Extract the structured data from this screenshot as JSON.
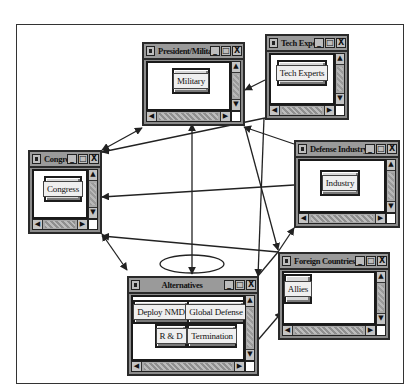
{
  "diagram": {
    "type": "influence network of windowed nodes",
    "colors": {
      "window_frame": "#8c8c8c",
      "title_bar": "#9a9a9a",
      "client": "#ffffff",
      "arrow": "#222222"
    }
  },
  "windows": {
    "president": {
      "title": "President/Military",
      "objects": [
        "Military"
      ]
    },
    "tech": {
      "title": "Tech Experts",
      "objects": [
        "Tech Experts"
      ]
    },
    "congress": {
      "title": "Congress",
      "objects": [
        "Congress"
      ]
    },
    "industry": {
      "title": "Defense Industry",
      "objects": [
        "Industry"
      ]
    },
    "foreign": {
      "title": "Foreign Countries",
      "objects": [
        "Allies"
      ]
    },
    "alternatives": {
      "title": "Alternatives",
      "objects": [
        "Deploy NMD",
        "Global Defense",
        "R & D",
        "Termination"
      ]
    }
  },
  "window_controls": {
    "minimize": "_",
    "maximize": "□",
    "close": "X",
    "scroll_up": "▲",
    "scroll_down": "▼",
    "scroll_left": "◀",
    "scroll_right": "▶"
  },
  "edges": [
    {
      "from": "Congress",
      "to": "President/Military",
      "bidirectional": true
    },
    {
      "from": "Tech Experts",
      "to": "Congress"
    },
    {
      "from": "Tech Experts",
      "to": "President/Military"
    },
    {
      "from": "Tech Experts",
      "to": "Alternatives"
    },
    {
      "from": "Defense Industry",
      "to": "Congress"
    },
    {
      "from": "Defense Industry",
      "to": "President/Military"
    },
    {
      "from": "President/Military",
      "to": "Alternatives"
    },
    {
      "from": "Congress",
      "to": "Alternatives",
      "bidirectional": true
    },
    {
      "from": "Foreign Countries",
      "to": "Congress"
    },
    {
      "from": "Foreign Countries",
      "to": "Defense Industry"
    },
    {
      "from": "Alternatives",
      "to": "Foreign Countries"
    },
    {
      "from": "Alternatives",
      "to": "Alternatives",
      "self_loop": true
    }
  ]
}
